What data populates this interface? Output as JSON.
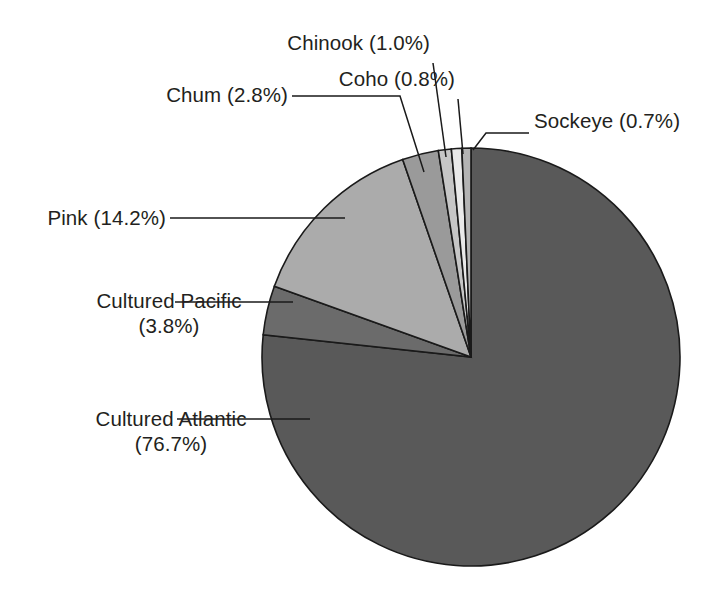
{
  "chart_data": {
    "type": "pie",
    "title": "",
    "subtitle": "",
    "xlabel": "",
    "ylabel": "",
    "units": "percent",
    "legend_position": "none",
    "grid": false,
    "label_format": "{name} ({value}%)",
    "start_angle_deg": 0,
    "direction": "clockwise",
    "categories": [
      "Cultured Atlantic",
      "Cultured Pacific",
      "Pink",
      "Chum",
      "Chinook",
      "Coho",
      "Sockeye"
    ],
    "values": [
      76.7,
      3.8,
      14.2,
      2.8,
      1.0,
      0.8,
      0.7
    ],
    "slices": [
      {
        "name": "Cultured Atlantic",
        "value": 76.7,
        "value_text": "76.7%",
        "label_line1": "Cultured Atlantic",
        "label_line2": "(76.7%)",
        "color": "#595959"
      },
      {
        "name": "Cultured Pacific",
        "value": 3.8,
        "value_text": "3.8%",
        "label_line1": "Cultured Pacific",
        "label_line2": "(3.8%)",
        "color": "#6b6b6b"
      },
      {
        "name": "Pink",
        "value": 14.2,
        "value_text": "14.2%",
        "label_line1": "Pink (14.2%)",
        "label_line2": "",
        "color": "#ababab"
      },
      {
        "name": "Chum",
        "value": 2.8,
        "value_text": "2.8%",
        "label_line1": "Chum (2.8%)",
        "label_line2": "",
        "color": "#9a9a9a"
      },
      {
        "name": "Chinook",
        "value": 1.0,
        "value_text": "1.0%",
        "label_line1": "Chinook (1.0%)",
        "label_line2": "",
        "color": "#c6c6c6"
      },
      {
        "name": "Coho",
        "value": 0.8,
        "value_text": "0.8%",
        "label_line1": "Coho (0.8%)",
        "label_line2": "",
        "color": "#e9e9e9"
      },
      {
        "name": "Sockeye",
        "value": 0.7,
        "value_text": "0.7%",
        "label_line1": "Sockeye (0.7%)",
        "label_line2": "",
        "color": "#b3b3b3"
      }
    ],
    "total": 100.0,
    "colors": {
      "outline": "#1a1a1a",
      "text": "#231f20",
      "background": "#ffffff"
    }
  }
}
